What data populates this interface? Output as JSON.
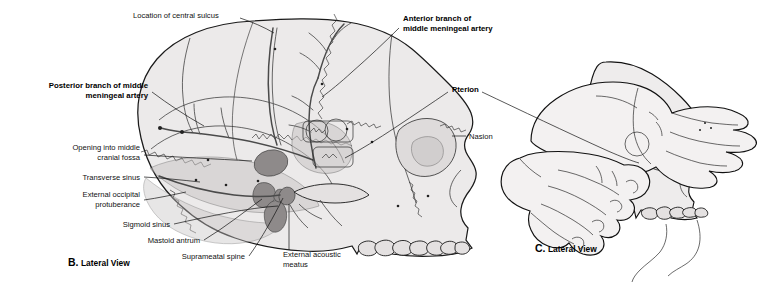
{
  "figure": {
    "background_color": "#ffffff",
    "bone_fill": "#eceaea",
    "shade_fill": "#c8c4c4",
    "vessel_color": "#4a4a4a",
    "line_color": "#111111"
  },
  "panels": [
    {
      "id": "B",
      "letter": "B.",
      "caption": "Lateral View",
      "full_caption": "B. Lateral View"
    },
    {
      "id": "C",
      "letter": "C.",
      "caption": "Lateral View",
      "full_caption": "C. Lateral View"
    }
  ],
  "labels": [
    {
      "id": "location-of-central-sulcus",
      "text": "Location of central sulcus",
      "lines": [
        "Location of central sulcus"
      ],
      "bold": false,
      "align": "left",
      "x": 133,
      "y": 18
    },
    {
      "id": "anterior-branch-of-middle-meningeal-artery",
      "text": "Anterior branch of middle meningeal artery",
      "lines": [
        "Anterior branch of",
        "middle meningeal artery"
      ],
      "bold": true,
      "align": "left",
      "x": 403,
      "y": 21
    },
    {
      "id": "posterior-branch-of-middle-meningeal-artery",
      "text": "Posterior branch of middle meningeal artery",
      "lines": [
        "Posterior branch of middle",
        "meningeal artery"
      ],
      "bold": true,
      "align": "right",
      "x": 148,
      "y": 88
    },
    {
      "id": "pterion",
      "text": "Pterion",
      "lines": [
        "Pterion"
      ],
      "bold": true,
      "align": "left",
      "x": 452,
      "y": 89
    },
    {
      "id": "nasion",
      "text": "Nasion",
      "lines": [
        "Nasion"
      ],
      "bold": false,
      "align": "left",
      "x": 469,
      "y": 137
    },
    {
      "id": "opening-into-middle-cranial-fossa",
      "text": "Opening into middle cranial fossa",
      "lines": [
        "Opening into middle",
        "cranial fossa"
      ],
      "bold": false,
      "align": "right",
      "x": 140,
      "y": 150
    },
    {
      "id": "transverse-sinus",
      "text": "Transverse sinus",
      "lines": [
        "Transverse sinus"
      ],
      "bold": false,
      "align": "right",
      "x": 140,
      "y": 179
    },
    {
      "id": "external-occipital-protuberance",
      "text": "External occipital protuberance",
      "lines": [
        "External occipital",
        "protuberance"
      ],
      "bold": false,
      "align": "right",
      "x": 140,
      "y": 196
    },
    {
      "id": "sigmoid-sinus",
      "text": "Sigmoid sinus",
      "lines": [
        "Sigmoid sinus"
      ],
      "bold": false,
      "align": "right",
      "x": 170,
      "y": 227
    },
    {
      "id": "mastoid-antrum",
      "text": "Mastoid antrum",
      "lines": [
        "Mastoid antrum"
      ],
      "bold": false,
      "align": "right",
      "x": 200,
      "y": 243
    },
    {
      "id": "suprameatal-spine",
      "text": "Suprameatal spine",
      "lines": [
        "Suprameatal spine"
      ],
      "bold": false,
      "align": "right",
      "x": 245,
      "y": 259
    },
    {
      "id": "external-acoustic-meatus",
      "text": "External acoustic meatus",
      "lines": [
        "External acoustic",
        "meatus"
      ],
      "bold": false,
      "align": "left",
      "x": 283,
      "y": 255
    }
  ],
  "captions": {
    "b_letter": "B.",
    "b_text": "Lateral View",
    "b_x": 68,
    "b_y": 263,
    "c_letter": "C.",
    "c_text": "Lateral View",
    "c_x": 535,
    "c_y": 249
  }
}
